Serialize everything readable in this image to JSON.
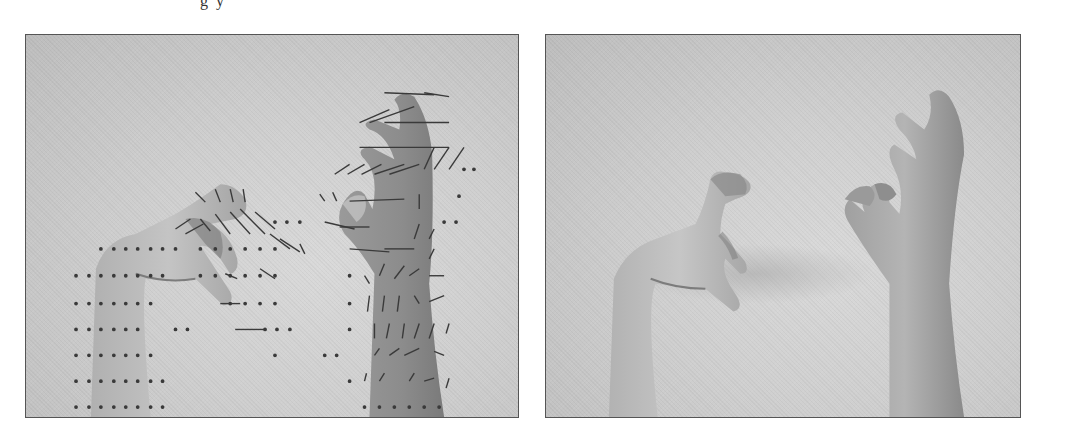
{
  "figure": {
    "top_text_fragment": "g  y",
    "panels": [
      {
        "id": "left",
        "description": "Two hands (left hand reaching, right hand raised) with overlaid optical flow vector field",
        "overlay": "flow-vectors"
      },
      {
        "id": "right",
        "description": "Same two hands without overlay",
        "overlay": "none"
      }
    ]
  },
  "colors": {
    "border": "#555555",
    "background_gray": "#cfcfcf",
    "skin_light": "#b8b8b8",
    "skin_dark": "#8a8a8a",
    "vector": "#3a3a3a"
  }
}
